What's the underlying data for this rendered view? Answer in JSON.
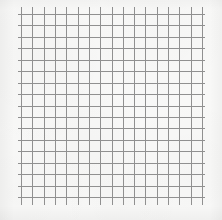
{
  "image": {
    "kind": "grid-paper-scan",
    "width": 222,
    "height": 220,
    "alt_text": "Scanned sheet of square grid paper with a 16 by 16 ruled grid"
  },
  "colors": {
    "paper_background": "#f8f8f7",
    "grid_line": "#8a8a8a",
    "grid_line_light": "#a3a3a3",
    "page_background": "#ffffff"
  },
  "grid": {
    "columns": 16,
    "rows": 16,
    "vertical_line_count": 17,
    "horizontal_line_count": 17,
    "cell_size_px": 11.3,
    "line_width_px": 1,
    "origin_x_px": 21,
    "origin_y_px": 14,
    "end_x_px": 202,
    "end_y_px": 197,
    "vertical_overhang_top_px": 7,
    "vertical_overhang_bottom_px": 8,
    "horizontal_overhang_left_px": 3,
    "horizontal_overhang_right_px": 3
  },
  "chart_data": {
    "type": "table",
    "title": "",
    "xlabel": "",
    "ylabel": "",
    "categories": [],
    "values": [],
    "note": "Blank ruled grid paper; no plotted data, labels, or annotations are present."
  }
}
